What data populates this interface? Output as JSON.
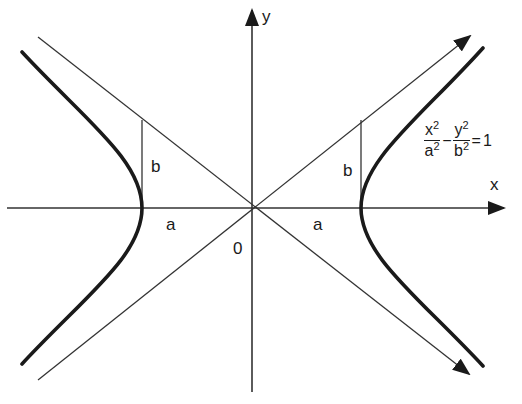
{
  "diagram": {
    "type": "hyperbola",
    "axes": {
      "x_label": "x",
      "y_label": "y",
      "origin_label": "0"
    },
    "equation": {
      "lhs1_num": "x",
      "lhs1_num_exp": "2",
      "lhs1_den": "a",
      "lhs1_den_exp": "2",
      "minus": "−",
      "lhs2_num": "y",
      "lhs2_num_exp": "2",
      "lhs2_den": "b",
      "lhs2_den_exp": "2",
      "equals": "=",
      "rhs": "1"
    },
    "labels": {
      "left_a": "a",
      "left_b": "b",
      "right_a": "a",
      "right_b": "b"
    },
    "colors": {
      "curve": "#1a1a1a",
      "line": "#333333"
    }
  }
}
